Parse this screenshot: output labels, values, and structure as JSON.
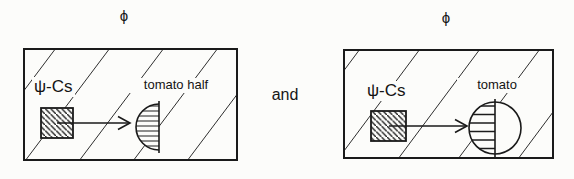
{
  "figure": {
    "connector": "and",
    "panels": [
      {
        "id": "left",
        "function_label": "ϕ",
        "psi_label": "ψ-Cs",
        "object_label": "tomato half"
      },
      {
        "id": "right",
        "function_label": "ϕ",
        "psi_label": "ψ-Cs",
        "object_label": "tomato"
      }
    ],
    "colors": {
      "ink": "#1a1a1a",
      "paper": "#fcfcfa"
    }
  }
}
